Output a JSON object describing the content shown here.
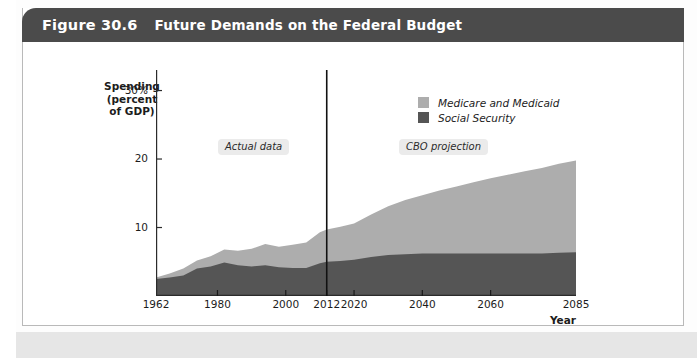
{
  "page": {
    "watermark_text": "system"
  },
  "header": {
    "figure_number": "Figure 30.6",
    "title": "Future Demands on the Federal Budget"
  },
  "axes": {
    "y_title_line1": "Spending",
    "y_title_line2": "(percent",
    "y_title_line3": "of GDP)",
    "x_title": "Year"
  },
  "legend": {
    "items": [
      {
        "label": "Medicare and Medicaid",
        "color": "#adadad"
      },
      {
        "label": "Social Security",
        "color": "#555555"
      }
    ]
  },
  "annotations": {
    "actual": "Actual data",
    "projection": "CBO projection"
  },
  "colors": {
    "medicare_medicaid": "#adadad",
    "social_security": "#555555",
    "axis": "#2b2b2b",
    "divider": "#111111",
    "header_bar": "#4b4b4b",
    "header_text": "#ffffff"
  },
  "chart_data": {
    "type": "area",
    "title": "Future Demands on the Federal Budget",
    "subtitle": "",
    "xlabel": "Year",
    "ylabel": "Spending (percent of GDP)",
    "stacked": true,
    "grid": false,
    "legend_position": "top-right",
    "xlim": [
      1962,
      2085
    ],
    "ylim": [
      0,
      33
    ],
    "y_ticks": [
      10,
      20,
      30
    ],
    "y_tick_labels": [
      "10",
      "20",
      "30%"
    ],
    "x_ticks": [
      1962,
      1980,
      2000,
      2012,
      2020,
      2040,
      2060,
      2085
    ],
    "x_tick_labels": [
      "1962",
      "1980",
      "2000",
      "2012",
      "2020",
      "2040",
      "2060",
      "2085"
    ],
    "divider_x": 2012,
    "annotations": [
      {
        "text": "Actual data",
        "x": 1985,
        "y": 27
      },
      {
        "text": "CBO projection",
        "x": 2033,
        "y": 27
      }
    ],
    "x": [
      1962,
      1966,
      1970,
      1974,
      1978,
      1982,
      1986,
      1990,
      1994,
      1998,
      2002,
      2006,
      2010,
      2012,
      2016,
      2020,
      2025,
      2030,
      2035,
      2040,
      2045,
      2050,
      2055,
      2060,
      2065,
      2070,
      2075,
      2080,
      2085
    ],
    "series": [
      {
        "name": "Social Security",
        "color": "#555555",
        "values": [
          2.5,
          2.7,
          3.0,
          4.0,
          4.3,
          4.9,
          4.5,
          4.3,
          4.5,
          4.2,
          4.1,
          4.1,
          4.8,
          5.0,
          5.1,
          5.3,
          5.7,
          6.0,
          6.1,
          6.2,
          6.2,
          6.2,
          6.2,
          6.2,
          6.2,
          6.2,
          6.2,
          6.3,
          6.4
        ]
      },
      {
        "name": "Medicare and Medicaid",
        "color": "#adadad",
        "values": [
          0.2,
          0.6,
          1.0,
          1.2,
          1.5,
          1.9,
          2.1,
          2.6,
          3.1,
          3.0,
          3.4,
          3.7,
          4.5,
          4.7,
          5.0,
          5.3,
          6.2,
          7.1,
          7.9,
          8.5,
          9.2,
          9.8,
          10.4,
          11.0,
          11.5,
          12.0,
          12.5,
          13.0,
          13.4
        ]
      }
    ],
    "totals": [
      2.7,
      3.3,
      4.0,
      5.2,
      5.8,
      6.8,
      6.6,
      6.9,
      7.6,
      7.2,
      7.5,
      7.8,
      9.3,
      9.7,
      10.1,
      10.6,
      11.9,
      13.1,
      14.0,
      14.7,
      15.4,
      16.0,
      16.6,
      17.2,
      17.7,
      18.2,
      18.7,
      19.3,
      19.8
    ]
  }
}
